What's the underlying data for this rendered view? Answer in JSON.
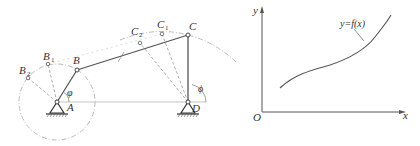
{
  "mechanism": {
    "title": "four-bar linkage",
    "labels": {
      "A": "A",
      "B": "B",
      "B1": "B",
      "B1_sub": "1",
      "B2": "B",
      "B2_sub": "2",
      "C": "C",
      "C1": "C",
      "C1_sub": "1",
      "C2": "C",
      "C2_sub": "2",
      "D": "D",
      "phi_input": "φ",
      "phi_output": "ϕ"
    },
    "colors": {
      "link": "#555555",
      "dashed": "#9a9a9a",
      "circle": "#a8a8a8"
    }
  },
  "plot": {
    "y_axis_label": "y",
    "x_axis_label": "x",
    "origin_label": "O",
    "curve_label": "y=f(x)",
    "colors": {
      "axis": "#555555",
      "curve": "#555555"
    }
  }
}
